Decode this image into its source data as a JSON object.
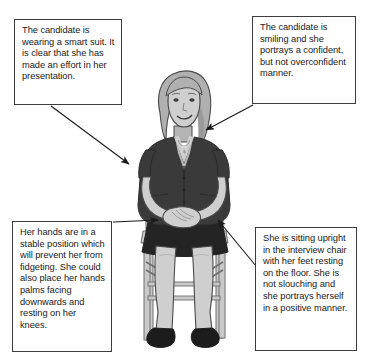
{
  "page": {
    "title_sliver": "",
    "background_color": "#ffffff",
    "width": 368,
    "height": 360
  },
  "colors": {
    "box_border": "#3d3d3d",
    "box_fill": "#ffffff",
    "text": "#1a1a1a",
    "arrow": "#1a1a1a",
    "suit_dark": "#3a3a3a",
    "suit_shadow": "#2b2b2b",
    "skirt": "#242424",
    "skin": "#cfcfcf",
    "skin_shade": "#b4b4b4",
    "hair": "#b0b0b0",
    "hair_shade": "#9a9a9a",
    "chair_wood": "#c9c9c9",
    "chair_line": "#6e6e6e",
    "shoe": "#1c1c1c",
    "outline": "#4a4a4a"
  },
  "callouts": [
    {
      "id": "suit",
      "name": "callout-suit",
      "text": "The candidate is wearing a smart suit. It is clear that  she has made an effort in her presentation.",
      "arrow_from": "bottom-left-of-box",
      "arrow_to": "left-shoulder"
    },
    {
      "id": "smile",
      "name": "callout-smile",
      "text": "The candidate is smiling and she portrays a confident, but not overconfident manner.",
      "arrow_from": "bottom-left-of-box",
      "arrow_to": "right-shoulder-hair"
    },
    {
      "id": "hands",
      "name": "callout-hands",
      "text": "Her hands are in a stable position which will prevent her from fidgeting. She could also place her hands palms facing downwards and resting on her knees.",
      "arrow_from": "right-of-box",
      "arrow_to": "hands-in-lap"
    },
    {
      "id": "posture",
      "name": "callout-posture",
      "text": "She is sitting upright in the interview chair with her feet resting on the floor. She is not slouching and she portrays herself in a positive manner.",
      "arrow_from": "top-left-of-box",
      "arrow_to": "right-hip"
    }
  ],
  "illustration": {
    "name": "seated-interview-candidate",
    "description": "Line illustration of a smiling woman in a dark suit sitting upright on a wooden chair, hands clasped in her lap, feet flat on the floor."
  }
}
